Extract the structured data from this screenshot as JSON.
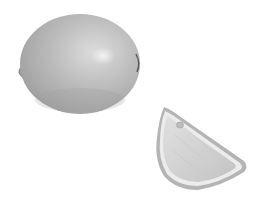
{
  "scene": {
    "description": "Grayscale photograph of a whole lemon and a lemon wedge on a white background",
    "background_color": "#ffffff",
    "objects": [
      {
        "name": "whole-lemon",
        "label": "Whole lemon",
        "fill": "#b8b8b8",
        "highlight": "#e6e6e6",
        "shadow": "#8a8a8a"
      },
      {
        "name": "lemon-wedge",
        "label": "Lemon wedge",
        "fill": "#d2d2d2",
        "rind": "#a8a8a8",
        "pith": "#ececec"
      }
    ]
  }
}
